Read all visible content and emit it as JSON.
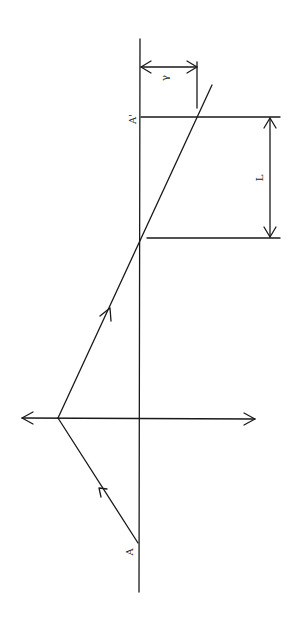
{
  "diagram": {
    "labels": {
      "source_point": "A",
      "image_point": "A'",
      "displacement": "L",
      "offset": "γ"
    },
    "colors": {
      "line": "#1a1a1a",
      "background": "#ffffff"
    },
    "elements": {
      "axis_line": "main vertical reference line",
      "mirror_line": "horizontal double-headed surface line",
      "incident_ray": "ray from A to reflection point",
      "reflected_ray": "ray from reflection point past A'",
      "L_dimension": "double-headed dimension arrow L",
      "gamma_dimension": "double-headed dimension arrow γ"
    }
  }
}
